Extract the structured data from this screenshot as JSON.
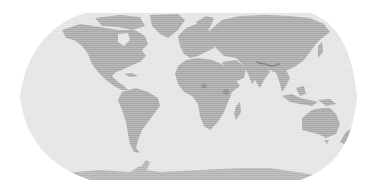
{
  "map": {
    "projection": "robinson-like",
    "style": "grayscale",
    "colors": {
      "background": "#ffffff",
      "ocean": "#e4e4e4",
      "land": "#a9a9a9",
      "land_dark": "#8e8e8e",
      "antarctica": "#b4b4b4",
      "grid_line": "#d8d8d8"
    },
    "features": [
      {
        "name": "North America"
      },
      {
        "name": "Greenland"
      },
      {
        "name": "South America"
      },
      {
        "name": "Europe"
      },
      {
        "name": "Africa"
      },
      {
        "name": "Asia"
      },
      {
        "name": "Australia"
      },
      {
        "name": "Antarctica"
      }
    ]
  }
}
